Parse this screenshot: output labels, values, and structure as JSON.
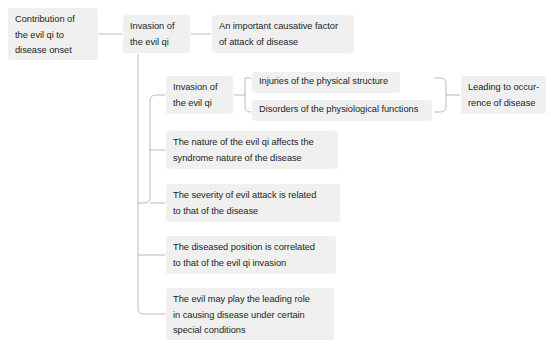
{
  "diagram": {
    "type": "tree-flowchart",
    "title_node": "Contribution of the evil qi to disease onset",
    "theme": {
      "node_background": "#f0f0f0",
      "text_color": "#231f20",
      "connector_color": "#b9b9b9",
      "page_background": "#ffffff"
    },
    "nodes": [
      {
        "id": "root",
        "text": "Contribution of\nthe evil qi to\ndisease onset",
        "x": 8,
        "y": 8,
        "width": 90,
        "height": 52
      },
      {
        "id": "invasion-main",
        "text": "Invasion of\nthe evil qi",
        "x": 123,
        "y": 15,
        "width": 67,
        "height": 38
      },
      {
        "id": "causative-factor",
        "text": "An important causative factor\nof attack of disease",
        "x": 212,
        "y": 15,
        "width": 142,
        "height": 38
      },
      {
        "id": "invasion-sub",
        "text": "Invasion of\nthe evil qi",
        "x": 166,
        "y": 76,
        "width": 67,
        "height": 38
      },
      {
        "id": "injuries-physical",
        "text": "Injuries of the physical structure",
        "x": 252,
        "y": 72,
        "width": 148,
        "height": 21
      },
      {
        "id": "disorders-physiological",
        "text": "Disorders of the physiological functions",
        "x": 252,
        "y": 100,
        "width": 180,
        "height": 21
      },
      {
        "id": "leading-occurrence",
        "text": "Leading to occur-\nrence of disease",
        "x": 461,
        "y": 76,
        "width": 85,
        "height": 38
      },
      {
        "id": "nature-affects",
        "text": "The nature of the evil qi affects the\nsyndrome nature of the disease",
        "x": 166,
        "y": 131,
        "width": 172,
        "height": 38
      },
      {
        "id": "severity-related",
        "text": "The severity of evil attack is related\nto that of the disease",
        "x": 166,
        "y": 184,
        "width": 174,
        "height": 38
      },
      {
        "id": "position-correlated",
        "text": "The diseased position is correlated\nto that of the evil qi invasion",
        "x": 166,
        "y": 236,
        "width": 170,
        "height": 38
      },
      {
        "id": "leading-role",
        "text": "The evil may play the leading role\nin causing disease under certain\nspecial conditions",
        "x": 166,
        "y": 288,
        "width": 168,
        "height": 52
      }
    ]
  }
}
